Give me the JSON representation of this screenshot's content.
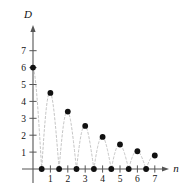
{
  "chart_data": {
    "type": "scatter",
    "title": "",
    "subtitle": "",
    "xlabel": "n",
    "ylabel": "D",
    "xlim": [
      -0.35,
      7.9
    ],
    "ylim": [
      -0.45,
      7.9
    ],
    "grid": false,
    "legend": null,
    "x_ticks": [
      1,
      2,
      3,
      4,
      5,
      6,
      7
    ],
    "x_tick_labels": [
      "1",
      "2",
      "3",
      "4",
      "5",
      "6",
      "7"
    ],
    "y_ticks": [
      1,
      2,
      3,
      4,
      5,
      6,
      7
    ],
    "y_tick_labels": [
      "1",
      "2",
      "3",
      "4",
      "5",
      "6",
      "7"
    ],
    "minor_x_ticks": [
      0.5,
      1.5,
      2.5,
      3.5,
      4.5,
      5.5,
      6.5
    ],
    "series": [
      {
        "name": "D(n)",
        "marker": "filled-circle",
        "marker_color": "#111111",
        "x": [
          0,
          0.5,
          1,
          1.5,
          2,
          2.5,
          3,
          3.5,
          4,
          4.5,
          5,
          5.5,
          6,
          6.5,
          7
        ],
        "y": [
          6,
          0,
          4.5,
          0,
          3.4,
          0,
          2.55,
          0,
          1.9,
          0,
          1.45,
          0,
          1.05,
          0,
          0.8
        ]
      },
      {
        "name": "damped-envelope-curve",
        "style": "dashed",
        "color": "#bdbdbd",
        "description": "decaying rectified sinusoid through the plotted points"
      }
    ],
    "annotations": []
  },
  "axes": {
    "y_axis_label": "D",
    "x_axis_label": "n"
  },
  "colors": {
    "marker": "#111111",
    "axis": "#555555",
    "dashed_curve": "#bdbdbd",
    "background": "#ffffff",
    "text": "#111111"
  }
}
